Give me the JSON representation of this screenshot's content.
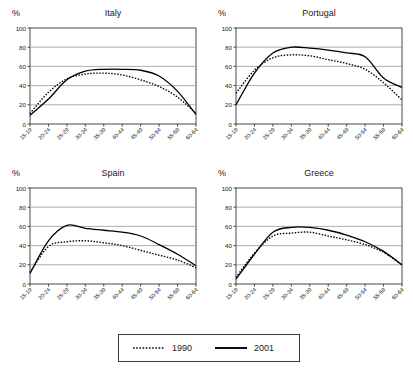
{
  "figure": {
    "pct_axis_label": "%",
    "truncated_top_caption": "",
    "legend": {
      "entries": [
        {
          "label": "1990",
          "style": "dotted",
          "color": "#000000"
        },
        {
          "label": "2001",
          "style": "solid",
          "color": "#000000"
        }
      ]
    }
  },
  "chart_data": [
    {
      "type": "line",
      "title": "Italy",
      "xlabel": "",
      "ylabel": "%",
      "ylim": [
        0,
        100
      ],
      "yticks": [
        0,
        20,
        40,
        60,
        80,
        100
      ],
      "grid": true,
      "legend_position": "bottom-shared",
      "categories": [
        "15-19",
        "20-24",
        "25-29",
        "30-34",
        "35-39",
        "40-44",
        "45-49",
        "50-54",
        "55-59",
        "60-64"
      ],
      "series": [
        {
          "name": "1990",
          "style": "dotted",
          "values": [
            11,
            33,
            47,
            52,
            53,
            51,
            46,
            39,
            28,
            11
          ]
        },
        {
          "name": "2001",
          "style": "solid",
          "values": [
            9,
            26,
            46,
            55,
            57,
            57,
            56,
            50,
            34,
            10
          ]
        }
      ]
    },
    {
      "type": "line",
      "title": "Portugal",
      "xlabel": "",
      "ylabel": "%",
      "ylim": [
        0,
        100
      ],
      "yticks": [
        0,
        20,
        40,
        60,
        80,
        100
      ],
      "grid": true,
      "legend_position": "bottom-shared",
      "categories": [
        "15-19",
        "20-24",
        "25-29",
        "30-34",
        "35-39",
        "40-44",
        "45-49",
        "50-54",
        "55-59",
        "60-64"
      ],
      "series": [
        {
          "name": "1990",
          "style": "dotted",
          "values": [
            32,
            56,
            69,
            72,
            71,
            67,
            63,
            57,
            43,
            25
          ]
        },
        {
          "name": "2001",
          "style": "solid",
          "values": [
            20,
            53,
            74,
            80,
            79,
            77,
            74,
            70,
            48,
            38
          ]
        }
      ]
    },
    {
      "type": "line",
      "title": "Spain",
      "xlabel": "",
      "ylabel": "%",
      "ylim": [
        0,
        100
      ],
      "yticks": [
        0,
        20,
        40,
        60,
        80,
        100
      ],
      "grid": true,
      "legend_position": "bottom-shared",
      "categories": [
        "15-19",
        "20-24",
        "25-29",
        "30-34",
        "35-39",
        "40-44",
        "45-49",
        "50-54",
        "55-59",
        "60-64"
      ],
      "series": [
        {
          "name": "1990",
          "style": "dotted",
          "values": [
            12,
            39,
            44,
            45,
            43,
            40,
            35,
            30,
            25,
            17
          ]
        },
        {
          "name": "2001",
          "style": "solid",
          "values": [
            11,
            45,
            61,
            58,
            56,
            54,
            50,
            41,
            31,
            19
          ]
        }
      ]
    },
    {
      "type": "line",
      "title": "Greece",
      "xlabel": "",
      "ylabel": "%",
      "ylim": [
        0,
        100
      ],
      "yticks": [
        0,
        20,
        40,
        60,
        80,
        100
      ],
      "grid": true,
      "legend_position": "bottom-shared",
      "categories": [
        "15-19",
        "20-24",
        "25-29",
        "30-34",
        "35-39",
        "40-44",
        "45-49",
        "50-54",
        "55-59",
        "60-64"
      ],
      "series": [
        {
          "name": "1990",
          "style": "dotted",
          "values": [
            7,
            32,
            50,
            53,
            54,
            50,
            46,
            41,
            33,
            20
          ]
        },
        {
          "name": "2001",
          "style": "solid",
          "values": [
            5,
            31,
            54,
            59,
            59,
            56,
            51,
            44,
            34,
            20
          ]
        }
      ]
    }
  ]
}
